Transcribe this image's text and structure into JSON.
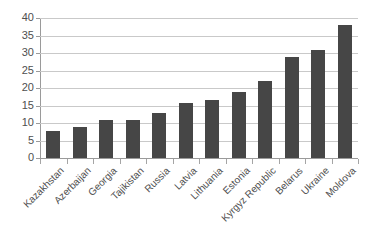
{
  "chart_data": {
    "type": "bar",
    "title": "",
    "subtitle": "",
    "xlabel": "",
    "ylabel": "",
    "ylim": [
      0,
      40
    ],
    "ytick_step": 5,
    "yticks": [
      "0",
      "5",
      "10",
      "15",
      "20",
      "25",
      "30",
      "35",
      "40"
    ],
    "grid": true,
    "legend": false,
    "legend_position": "none",
    "orientation": "vertical",
    "bar_color": "#464646",
    "gridline_color": "#c9c9c9",
    "axis_color": "#9a9a9a",
    "label_color": "#4f4f4f",
    "categories": [
      "Kazakhstan",
      "Azerbaijan",
      "Georgia",
      "Tajikistan",
      "Russia",
      "Latvia",
      "Lithuania",
      "Estonia",
      "Kyrgyz Republic",
      "Belarus",
      "Ukraine",
      "Moldova"
    ],
    "values": [
      7.7,
      8.8,
      10.8,
      10.8,
      12.8,
      15.8,
      16.7,
      18.8,
      22.0,
      29.0,
      31.0,
      38.0
    ]
  }
}
